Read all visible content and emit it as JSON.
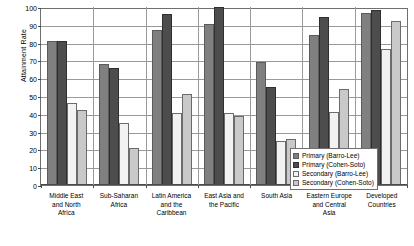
{
  "chart_data": {
    "type": "bar",
    "title": "",
    "xlabel": "",
    "ylabel": "Attainment Rate",
    "ylim": [
      0,
      100
    ],
    "ytick_step": 10,
    "yticks": [
      0,
      10,
      20,
      30,
      40,
      50,
      60,
      70,
      80,
      90,
      100
    ],
    "grid": true,
    "legend_position": "inside-right-bottom",
    "categories": [
      "Middle East and North Africa",
      "Sub-Saharan Africa",
      "Latin America and the Caribbean",
      "East Asia and the Pacific",
      "South Asia",
      "Eastern Europe and Central Asia",
      "Developed Countries"
    ],
    "category_lines": [
      [
        "Middle East",
        "and North",
        "Africa"
      ],
      [
        "Sub-Saharan",
        "Africa"
      ],
      [
        "Latin America",
        "and the",
        "Caribbean"
      ],
      [
        "East Asia and",
        "the Pacific"
      ],
      [
        "South Asia"
      ],
      [
        "Eastern Europe",
        "and Central",
        "Asia"
      ],
      [
        "Developed",
        "Countries"
      ]
    ],
    "series": [
      {
        "name": "Primary (Barro-Lee)",
        "color": "#808080",
        "values": [
          81,
          68,
          87,
          90.5,
          69,
          84.5,
          96.5
        ]
      },
      {
        "name": "Primary (Cohen-Soto)",
        "color": "#4d4d4d",
        "values": [
          81,
          65.5,
          96,
          100,
          55,
          94.5,
          98.5
        ]
      },
      {
        "name": "Secondary (Barro-Lee)",
        "color": "#f2f2f2",
        "values": [
          46,
          35,
          40.5,
          40.5,
          25,
          41,
          76.5
        ]
      },
      {
        "name": "Secondary (Cohen-Soto)",
        "color": "#c9c9c9",
        "values": [
          42,
          21,
          51,
          38.5,
          26,
          54,
          92
        ]
      }
    ]
  },
  "legend": {
    "items": [
      "Primary (Barro-Lee)",
      "Primary (Cohen-Soto)",
      "Secondary (Barro-Lee)",
      "Secondary (Cohen-Soto)"
    ]
  }
}
